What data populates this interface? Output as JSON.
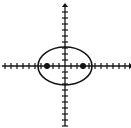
{
  "figure": {
    "background_color": "#ffffff",
    "stroke_color": "#141414",
    "width": 131,
    "height": 128
  },
  "chart_data": {
    "type": "scatter",
    "title": "",
    "xlabel": "",
    "ylabel": "",
    "grid": false,
    "legend": false,
    "axes": {
      "origin_px": {
        "x": 65,
        "y": 66
      },
      "tick_spacing_px": 6,
      "x_axis": {
        "start_px": 2,
        "end_px": 129,
        "arrow_left": false,
        "arrow_right": true,
        "tick_count_left": 10,
        "tick_count_right": 10,
        "tick_half_length_px": 3
      },
      "y_axis": {
        "start_px": 3,
        "end_px": 126,
        "arrow_top": true,
        "arrow_bottom": false,
        "tick_count_up": 10,
        "tick_count_down": 10,
        "tick_half_length_px": 3
      }
    },
    "shapes": [
      {
        "kind": "ellipse",
        "center_px": {
          "x": 65,
          "y": 66
        },
        "semi_major_axis_px": 27,
        "semi_minor_axis_px": 19,
        "semi_major_axis_units": 4.5,
        "semi_minor_axis_units": 3.2,
        "orientation": "horizontal",
        "stroke_width_px": 1.6,
        "fill": "none",
        "stroke": "#141414"
      }
    ],
    "points": [
      {
        "name": "left-focus",
        "px": {
          "x": 47,
          "y": 66
        },
        "units": {
          "x": -3.0,
          "y": 0
        },
        "marker": "filled-square-dot",
        "radius_px": 3,
        "color": "#141414"
      },
      {
        "name": "right-focus",
        "px": {
          "x": 83,
          "y": 66
        },
        "units": {
          "x": 3.0,
          "y": 0
        },
        "marker": "filled-square-dot",
        "radius_px": 3,
        "color": "#141414"
      }
    ],
    "annotations": []
  }
}
